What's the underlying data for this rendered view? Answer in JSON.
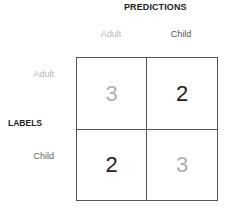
{
  "titles": {
    "predictions": "PREDICTIONS",
    "labels": "LABELS"
  },
  "columns": [
    "Adult",
    "Child"
  ],
  "rows": [
    "Adult",
    "Child"
  ],
  "matrix": [
    [
      3,
      2
    ],
    [
      2,
      3
    ]
  ],
  "colors": {
    "diagonal_text": "#b0b0b0",
    "off_diagonal_text": "#222222",
    "border": "#555555"
  }
}
